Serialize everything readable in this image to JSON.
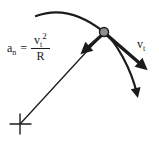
{
  "formula": {
    "lhs_base": "a",
    "lhs_sub": "n",
    "equals": "=",
    "num_base": "v",
    "num_sub": "t",
    "num_sup": "2",
    "den": "R"
  },
  "velocity_label": {
    "base": "v",
    "sub": "t"
  },
  "colors": {
    "ink": "#1b1b1b",
    "dot": "#8f8f8f",
    "bg": "#ffffff"
  }
}
